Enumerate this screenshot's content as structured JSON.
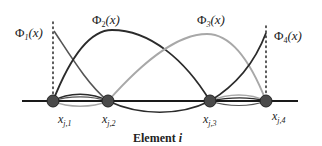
{
  "diagram": {
    "basis_labels": [
      {
        "id": "phi1",
        "symbol": "Φ",
        "sub": "1",
        "arg": "(x)"
      },
      {
        "id": "phi2",
        "symbol": "Φ",
        "sub": "2",
        "arg": "(x)"
      },
      {
        "id": "phi3",
        "symbol": "Φ",
        "sub": "3",
        "arg": "(x)"
      },
      {
        "id": "phi4",
        "symbol": "Φ",
        "sub": "4",
        "arg": "(x)"
      }
    ],
    "nodes": [
      {
        "base": "x",
        "sub": "j,1"
      },
      {
        "base": "x",
        "sub": "j,2"
      },
      {
        "base": "x",
        "sub": "j,3"
      },
      {
        "base": "x",
        "sub": "j,4"
      }
    ],
    "element_label": {
      "text": "Element ",
      "var": "i"
    },
    "colors": {
      "dark_curve": "#2b2b2b",
      "mid_curve": "#555555",
      "light_curve": "#a8a8a8",
      "node_fill": "#4a4a4a",
      "axis": "#1a1a1a"
    }
  }
}
